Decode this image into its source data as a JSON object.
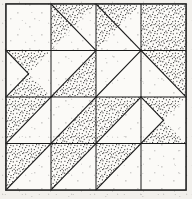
{
  "figure": {
    "name": "pieced-quilt-block-diagram",
    "width": 192,
    "height": 199
  },
  "style": {
    "background_color": "#f2f0ec",
    "paper_color": "#faf9f6",
    "line_color": "#1a1a1a",
    "stipple_color": "#2b2b2b",
    "white_patch_color": "#fbfaf7",
    "outer_border_color": "#3a3a3a",
    "line_width": 1.1,
    "grid_line_width": 1.0
  },
  "block": {
    "columns": 4,
    "rows": 4,
    "frame": {
      "x": 6,
      "y": 4,
      "width": 180,
      "height": 186
    },
    "column_edges": [
      6,
      51,
      96,
      141,
      186
    ],
    "row_edges": [
      4,
      50.5,
      97,
      143.5,
      190
    ]
  },
  "patches": [
    {
      "id": "r0c0",
      "name": "plain-white-square",
      "fill": "white",
      "points": "6,4 51,4 51,50.5 6,50.5"
    },
    {
      "id": "r0c1-a",
      "name": "stipple-triangle-upper-left",
      "fill": "stipple",
      "points": "51,4 96,4 51,50.5"
    },
    {
      "id": "r0c1-b",
      "name": "white-triangle-lower-right",
      "fill": "white",
      "points": "96,4 96,50.5 51,50.5"
    },
    {
      "id": "r0c2",
      "name": "stipple-triangle-hourglass-left",
      "fill": "stipple",
      "points": "96,4 141,4 96,50.5"
    },
    {
      "id": "r0c2-b",
      "name": "white-triangle-hourglass-right",
      "fill": "white",
      "points": "141,4 141,50.5 96,50.5"
    },
    {
      "id": "r0c3",
      "name": "stipple-square-corner",
      "fill": "stipple",
      "points": "141,4 186,4 186,50.5 141,50.5"
    },
    {
      "id": "r1c0-a",
      "name": "stipple-chevron-left",
      "fill": "stipple",
      "points": "6,50.5 51,50.5 28.5,73.75 51,97 6,97"
    },
    {
      "id": "r1c0-b",
      "name": "white-chevron-notch",
      "fill": "white",
      "points": "6,50.5 28.5,73.75 6,97"
    },
    {
      "id": "r1c1",
      "name": "white-triangle-upper",
      "fill": "white",
      "points": "51,50.5 96,50.5 51,97"
    },
    {
      "id": "r1c1-b",
      "name": "stipple-triangle-lower",
      "fill": "stipple",
      "points": "96,50.5 96,97 51,97"
    },
    {
      "id": "r1c2",
      "name": "white-triangle-sash-upper",
      "fill": "white",
      "points": "96,50.5 141,50.5 96,97"
    },
    {
      "id": "r1c3-a",
      "name": "stipple-triangle-top-right",
      "fill": "stipple",
      "points": "141,50.5 186,50.5 186,97 141,97"
    },
    {
      "id": "r1c3-b",
      "name": "white-triangle-inner",
      "fill": "white",
      "points": "141,50.5 141,97 186,97"
    },
    {
      "id": "r2c0-a",
      "name": "stipple-triangle-lower-left",
      "fill": "stipple",
      "points": "6,97 51,97 6,143.5"
    },
    {
      "id": "r2c0-b",
      "name": "white-triangle-big",
      "fill": "white",
      "points": "51,97 51,143.5 6,143.5"
    },
    {
      "id": "r2c1",
      "name": "white-triangle-center-left",
      "fill": "white",
      "points": "51,97 96,97 51,143.5"
    },
    {
      "id": "r2c1-b",
      "name": "stipple-sash-diagonal",
      "fill": "stipple",
      "points": "96,97 96,143.5 51,143.5"
    },
    {
      "id": "r2c2-a",
      "name": "stipple-triangle-center-right",
      "fill": "stipple",
      "points": "96,97 141,97 96,143.5"
    },
    {
      "id": "r2c2-b",
      "name": "white-triangle-center-right",
      "fill": "white",
      "points": "141,97 141,143.5 96,143.5"
    },
    {
      "id": "r2c3-a",
      "name": "stipple-chevron-right",
      "fill": "stipple",
      "points": "141,97 186,97 186,143.5 141,143.5 163.5,120.25"
    },
    {
      "id": "r2c3-b",
      "name": "white-chevron-notch-right",
      "fill": "white",
      "points": "186,97 186,143.5 163.5,120.25"
    },
    {
      "id": "r3c0-a",
      "name": "stipple-triangle-bottom-left",
      "fill": "stipple",
      "points": "6,143.5 51,143.5 6,190"
    },
    {
      "id": "r3c0-b",
      "name": "white-triangle-bottom-left",
      "fill": "white",
      "points": "51,143.5 51,190 6,190"
    },
    {
      "id": "r3c1-a",
      "name": "stipple-triangle-bottom-mid",
      "fill": "stipple",
      "points": "51,143.5 96,143.5 51,190"
    },
    {
      "id": "r3c1-b",
      "name": "white-triangle-bottom-mid",
      "fill": "white",
      "points": "96,143.5 96,190 51,190"
    },
    {
      "id": "r3c2-a",
      "name": "stipple-triangle-bottom-right-a",
      "fill": "stipple",
      "points": "96,143.5 141,143.5 96,190"
    },
    {
      "id": "r3c2-b",
      "name": "white-triangle-bottom-right-b",
      "fill": "white",
      "points": "141,143.5 141,190 96,190"
    },
    {
      "id": "r3c3",
      "name": "plain-white-square-corner",
      "fill": "white",
      "points": "141,143.5 186,143.5 186,190 141,190"
    }
  ],
  "seam_lines": [
    {
      "name": "vertical-seam-1",
      "x1": 51,
      "y1": 4,
      "x2": 51,
      "y2": 190
    },
    {
      "name": "vertical-seam-2",
      "x1": 96,
      "y1": 4,
      "x2": 96,
      "y2": 190
    },
    {
      "name": "vertical-seam-3",
      "x1": 141,
      "y1": 4,
      "x2": 141,
      "y2": 190
    },
    {
      "name": "horizontal-seam-1",
      "x1": 6,
      "y1": 50.5,
      "x2": 186,
      "y2": 50.5
    },
    {
      "name": "horizontal-seam-2",
      "x1": 6,
      "y1": 97,
      "x2": 186,
      "y2": 97
    },
    {
      "name": "horizontal-seam-3",
      "x1": 6,
      "y1": 143.5,
      "x2": 186,
      "y2": 143.5
    }
  ]
}
